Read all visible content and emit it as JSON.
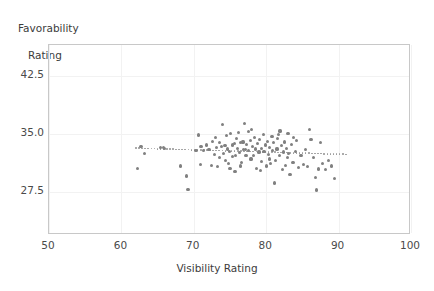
{
  "chart_data": {
    "type": "scatter",
    "title": "",
    "xlabel": "Visibility Rating",
    "ylabel": "Favorability\nRating",
    "ylabel_line1": "Favorability",
    "ylabel_line2": "Rating",
    "xlim": [
      50,
      100
    ],
    "ylim": [
      22.0,
      46.5
    ],
    "xticks": [
      50,
      60,
      70,
      80,
      90,
      100
    ],
    "yticks": [
      27.5,
      35.0,
      42.5
    ],
    "xtick_labels": [
      "50",
      "60",
      "70",
      "80",
      "90",
      "100"
    ],
    "ytick_labels": [
      "27.5",
      "35.0",
      "42.5"
    ],
    "grid": true,
    "legend": false,
    "marker_color": "#808080",
    "marker_size": 3.2,
    "frame_color": "#c8c8c8",
    "grid_color": "#f2f2f2",
    "trendline": {
      "style": "dotted",
      "color": "#9a9a9a",
      "x_start": 62.0,
      "x_end": 91.0,
      "y_start": 33.2,
      "y_end": 32.4
    },
    "points": [
      [
        62.2,
        30.6
      ],
      [
        62.7,
        33.4
      ],
      [
        63.2,
        32.5
      ],
      [
        65.4,
        33.3
      ],
      [
        65.8,
        33.3
      ],
      [
        66.0,
        33.2
      ],
      [
        68.2,
        30.9
      ],
      [
        69.0,
        29.6
      ],
      [
        69.2,
        27.9
      ],
      [
        70.3,
        32.9
      ],
      [
        70.6,
        34.9
      ],
      [
        70.9,
        31.1
      ],
      [
        71.3,
        32.9
      ],
      [
        71.8,
        33.6
      ],
      [
        72.1,
        33.0
      ],
      [
        72.4,
        31.0
      ],
      [
        72.6,
        34.1
      ],
      [
        72.9,
        32.4
      ],
      [
        73.1,
        33.3
      ],
      [
        73.3,
        30.8
      ],
      [
        73.5,
        33.9
      ],
      [
        73.8,
        33.4
      ],
      [
        74.0,
        36.3
      ],
      [
        74.1,
        32.5
      ],
      [
        74.3,
        33.5
      ],
      [
        74.5,
        34.8
      ],
      [
        74.6,
        33.1
      ],
      [
        74.8,
        31.2
      ],
      [
        74.9,
        32.8
      ],
      [
        75.1,
        35.1
      ],
      [
        75.3,
        33.6
      ],
      [
        75.4,
        32.1
      ],
      [
        75.6,
        33.8
      ],
      [
        75.7,
        30.2
      ],
      [
        75.9,
        34.4
      ],
      [
        76.0,
        33.2
      ],
      [
        76.2,
        35.2
      ],
      [
        76.3,
        32.6
      ],
      [
        76.5,
        33.9
      ],
      [
        76.6,
        31.4
      ],
      [
        76.8,
        34.0
      ],
      [
        76.9,
        33.0
      ],
      [
        77.0,
        36.4
      ],
      [
        77.2,
        32.3
      ],
      [
        77.3,
        33.7
      ],
      [
        77.5,
        35.3
      ],
      [
        77.6,
        32.9
      ],
      [
        77.8,
        34.2
      ],
      [
        77.9,
        31.8
      ],
      [
        78.1,
        33.4
      ],
      [
        78.2,
        32.2
      ],
      [
        78.4,
        34.6
      ],
      [
        78.5,
        33.1
      ],
      [
        78.7,
        30.6
      ],
      [
        78.8,
        33.8
      ],
      [
        79.0,
        32.7
      ],
      [
        79.1,
        34.3
      ],
      [
        79.3,
        31.5
      ],
      [
        79.4,
        33.2
      ],
      [
        79.6,
        35.0
      ],
      [
        79.7,
        32.8
      ],
      [
        79.9,
        33.6
      ],
      [
        80.0,
        30.9
      ],
      [
        80.2,
        34.1
      ],
      [
        80.3,
        32.4
      ],
      [
        80.5,
        33.3
      ],
      [
        80.6,
        31.2
      ],
      [
        80.8,
        34.7
      ],
      [
        80.9,
        32.9
      ],
      [
        81.0,
        33.9
      ],
      [
        81.2,
        28.7
      ],
      [
        81.3,
        31.6
      ],
      [
        81.5,
        33.1
      ],
      [
        81.6,
        34.4
      ],
      [
        81.8,
        32.2
      ],
      [
        81.9,
        35.4
      ],
      [
        82.1,
        33.5
      ],
      [
        82.2,
        30.4
      ],
      [
        82.4,
        32.7
      ],
      [
        82.5,
        34.0
      ],
      [
        82.7,
        31.0
      ],
      [
        82.8,
        33.2
      ],
      [
        83.0,
        35.1
      ],
      [
        83.1,
        32.5
      ],
      [
        83.3,
        29.8
      ],
      [
        83.5,
        33.7
      ],
      [
        83.7,
        31.3
      ],
      [
        84.0,
        32.8
      ],
      [
        84.2,
        34.2
      ],
      [
        84.5,
        30.7
      ],
      [
        84.8,
        32.3
      ],
      [
        85.1,
        31.1
      ],
      [
        85.4,
        33.0
      ],
      [
        85.7,
        30.8
      ],
      [
        86.0,
        35.6
      ],
      [
        86.2,
        34.3
      ],
      [
        86.5,
        32.0
      ],
      [
        86.8,
        29.4
      ],
      [
        87.0,
        27.8
      ],
      [
        87.2,
        30.5
      ],
      [
        87.5,
        33.9
      ],
      [
        87.8,
        31.2
      ],
      [
        88.2,
        30.4
      ],
      [
        88.6,
        31.6
      ],
      [
        89.0,
        30.9
      ],
      [
        89.4,
        29.3
      ],
      [
        73.0,
        34.6
      ],
      [
        75.0,
        30.6
      ],
      [
        78.0,
        35.6
      ],
      [
        80.4,
        31.8
      ],
      [
        76.4,
        30.9
      ],
      [
        74.4,
        31.6
      ],
      [
        79.2,
        30.3
      ],
      [
        81.7,
        35.0
      ],
      [
        83.8,
        34.6
      ],
      [
        71.0,
        33.4
      ],
      [
        77.1,
        33.0
      ],
      [
        82.9,
        32.0
      ],
      [
        75.8,
        32.3
      ],
      [
        73.6,
        32.0
      ]
    ]
  }
}
